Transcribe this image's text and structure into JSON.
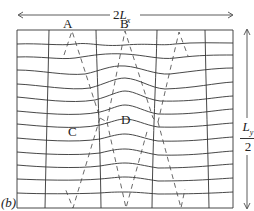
{
  "figure": {
    "panel_label": "(b)",
    "width_label_prefix": "2",
    "width_label_var": "L",
    "width_label_sub": "x",
    "height_label_var": "L",
    "height_label_sub": "y",
    "height_label_denominator": "2",
    "points": [
      {
        "name": "A",
        "x": 70,
        "y": 27
      },
      {
        "name": "B",
        "x": 125,
        "y": 27
      },
      {
        "name": "C",
        "x": 73,
        "y": 132
      },
      {
        "name": "D",
        "x": 125,
        "y": 122
      }
    ],
    "line_color": "#222222",
    "grid": {
      "vertical_lines": 6,
      "horizontal_lines": 14
    }
  }
}
